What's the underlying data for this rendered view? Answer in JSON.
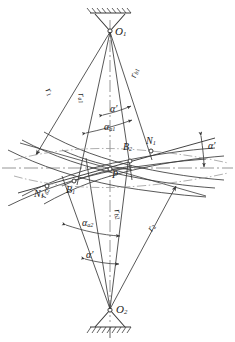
{
  "figure": {
    "width": 235,
    "height": 342,
    "background": "#ffffff",
    "line_color": "#3a3a3a",
    "axis_color": "#777777"
  },
  "labels": {
    "center_top": "O",
    "center_top_sub": "1",
    "center_bottom": "O",
    "center_bottom_sub": "2",
    "pitch_point": "P",
    "contact_b1": "B",
    "contact_b1_sub": "1",
    "contact_b2": "B",
    "contact_b2_sub": "2",
    "node_n1": "N",
    "node_n1_sub": "1",
    "node_n1p": "N",
    "node_n1p_sub": "1",
    "node_n1p_prime": "′",
    "radius_r1": "r",
    "radius_r1_sub": "1",
    "radius_r2": "r",
    "radius_r2_sub": "2",
    "radius_ra1": "r",
    "radius_ra1_sub": "a1",
    "radius_ra2": "r",
    "radius_ra2_sub": "a2",
    "radius_rb1": "r",
    "radius_rb1_sub": "b1",
    "radius_rb2": "r",
    "radius_rb2_sub": "b2",
    "angle_aa1": "α",
    "angle_aa1_sub": "a1",
    "angle_aa2": "α",
    "angle_aa2_sub": "a2",
    "angle_prime_top": "α′",
    "angle_prime_bottom": "α′",
    "angle_prime_right": "α′"
  }
}
